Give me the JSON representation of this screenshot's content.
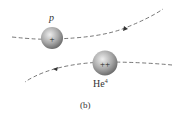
{
  "diagram": {
    "particles": [
      {
        "name": "proton",
        "label": "p",
        "charge": "+"
      },
      {
        "name": "helium-4",
        "label_base": "He",
        "label_sup": "4",
        "charge": "++"
      }
    ],
    "caption": "(b)",
    "colors": {
      "path": "#555555",
      "sphere_light": "#e8e8e8",
      "sphere_dark": "#7a7a7a"
    }
  }
}
